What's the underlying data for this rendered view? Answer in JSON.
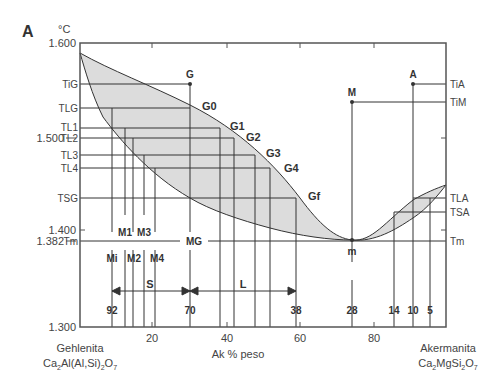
{
  "panel_label": "A",
  "y_unit": "°C",
  "y_ticks": [
    {
      "label": "1.600",
      "y": 43
    },
    {
      "label": "1.500",
      "y": 138
    },
    {
      "label": "1.400",
      "y": 230
    },
    {
      "label": "1.382",
      "y": 241
    },
    {
      "label": "1.300",
      "y": 327
    }
  ],
  "x_ticks": [
    {
      "label": "20",
      "x": 152
    },
    {
      "label": "40",
      "x": 227
    },
    {
      "label": "60",
      "x": 300
    },
    {
      "label": "80",
      "x": 374
    }
  ],
  "x_axis_title": "Ak % peso",
  "left_endmember": {
    "name": "Gehlenita",
    "formula": "Ca2Al(Al,Si)2O7"
  },
  "right_endmember": {
    "name": "Akermanita",
    "formula": "Ca2MgSi2O7"
  },
  "left_temps": {
    "TiG": "TiG",
    "TLG": "TLG",
    "TL1": "TL1",
    "TL2": "TL2",
    "TL3": "TL3",
    "TL4": "TL4",
    "TSG": "TSG",
    "Tm": "Tm"
  },
  "right_temps": {
    "TiA": "TiA",
    "TiM": "TiM",
    "TLA": "TLA",
    "TSA": "TSA",
    "Tm": "Tm"
  },
  "points": {
    "G": "G",
    "G0": "G0",
    "G1": "G1",
    "G2": "G2",
    "G3": "G3",
    "G4": "G4",
    "Gf": "Gf",
    "M": "M",
    "A": "A",
    "m": "m",
    "MG": "MG",
    "M1": "M1",
    "M2": "M2",
    "M3": "M3",
    "M4": "M4",
    "Mi": "Mi"
  },
  "ranges": {
    "S": "S",
    "L": "L"
  },
  "composition_labels": [
    {
      "label": "92",
      "x": 112
    },
    {
      "label": "70",
      "x": 190
    },
    {
      "label": "38",
      "x": 296
    },
    {
      "label": "28",
      "x": 352
    },
    {
      "label": "14",
      "x": 394
    },
    {
      "label": "10",
      "x": 413
    },
    {
      "label": "5",
      "x": 430
    }
  ],
  "colors": {
    "fill": "#dcdcdc",
    "line": "#333333",
    "frame": "#555555"
  }
}
